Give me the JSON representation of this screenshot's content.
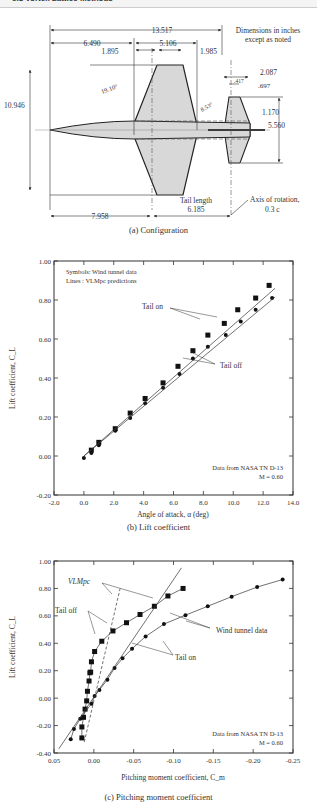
{
  "header": {
    "title": "6.8 Vortex Lattice Methods"
  },
  "figure_a": {
    "caption": "(a) Configuration",
    "note_line1": "Dimensions in inches",
    "note_line2": "except as noted",
    "dimensions": {
      "overall_length": "13.517",
      "nose_to_wing": "6.490",
      "wing_root_chord": "5.106",
      "wing_le_offset": "1.895",
      "wing_te_offset": "1.985",
      "span": "10.946",
      "wing_sweep": "19.10°",
      "tail_sweep": "8.53°",
      "tail_dim_1": "2.087",
      "tail_dim_2": ".417",
      "tail_dim_3": ".697",
      "tail_dim_4": "1.170",
      "tail_span": "5.560",
      "nose_to_axis": "7.958",
      "tail_length_label": "Tail length",
      "tail_length": "6.185",
      "axis_label_1": "Axis of rotation,",
      "axis_label_2": "0.3 c"
    }
  },
  "chart_data": [
    {
      "type": "scatter",
      "title": "(b) Lift coefficient",
      "xlabel": "Angle of attack, α (deg)",
      "ylabel": "Lift coefficient, C_L",
      "xlim": [
        -2.0,
        14.0
      ],
      "ylim": [
        -0.2,
        1.0
      ],
      "xticks": [
        "-2.0",
        "0.0",
        "2.0",
        "4.0",
        "6.0",
        "8.0",
        "10.0",
        "12.0",
        "14.0"
      ],
      "yticks": [
        "-0.20",
        "0.00",
        "0.20",
        "0.40",
        "0.60",
        "0.80",
        "1.00"
      ],
      "legend": [
        "Symbols: Wind tunnel data",
        "Lines : VLMpc predictions"
      ],
      "annotations": [
        "Tail on",
        "Tail off",
        "Data from NASA TN D-13",
        "M = 0.60"
      ],
      "series": [
        {
          "name": "Tail on (wind tunnel)",
          "marker": "square",
          "x": [
            0.5,
            1.0,
            2.1,
            3.1,
            4.1,
            5.3,
            6.3,
            7.3,
            8.3,
            9.4,
            10.3,
            11.5,
            12.4
          ],
          "y": [
            0.03,
            0.07,
            0.14,
            0.22,
            0.295,
            0.375,
            0.46,
            0.54,
            0.62,
            0.68,
            0.75,
            0.81,
            0.875
          ]
        },
        {
          "name": "Tail off (wind tunnel)",
          "marker": "circle",
          "x": [
            0.0,
            0.5,
            1.0,
            2.1,
            3.1,
            4.1,
            5.3,
            6.4,
            7.3,
            8.3,
            9.5,
            10.5,
            11.5,
            12.6
          ],
          "y": [
            -0.01,
            0.015,
            0.055,
            0.13,
            0.195,
            0.27,
            0.35,
            0.42,
            0.5,
            0.56,
            0.62,
            0.69,
            0.75,
            0.81
          ]
        },
        {
          "name": "Tail on (VLMpc)",
          "line": true,
          "x": [
            0.0,
            12.8
          ],
          "y": [
            0.0,
            0.86
          ]
        },
        {
          "name": "Tail off (VLMpc)",
          "line": true,
          "x": [
            0.0,
            12.8
          ],
          "y": [
            0.0,
            0.815
          ]
        }
      ]
    },
    {
      "type": "line",
      "title": "(c) Pitching moment coefficient",
      "xlabel": "Pitching moment coefficient, C_m",
      "ylabel": "Lift coefficient, C_L",
      "xlim": [
        0.05,
        -0.25
      ],
      "ylim": [
        -0.4,
        1.0
      ],
      "xticks": [
        "0.05",
        "0.00",
        "-0.05",
        "-0.10",
        "-0.15",
        "-0.20",
        "-0.25"
      ],
      "yticks": [
        "-0.40",
        "-0.20",
        "0.00",
        "0.20",
        "0.40",
        "0.60",
        "0.80",
        "1.00"
      ],
      "annotations": [
        "VLMpc",
        "Tail off",
        "Tail on",
        "Wind tunnel data",
        "Data from NASA TN D-13",
        "M = 0.60"
      ],
      "series": [
        {
          "name": "Tail off (wind tunnel)",
          "marker": "square",
          "x": [
            0.015,
            0.015,
            0.013,
            0.011,
            0.009,
            0.008,
            0.006,
            0.005,
            0.004,
            0.003,
            -0.001,
            -0.01,
            -0.024,
            -0.041,
            -0.058,
            -0.076,
            -0.093,
            -0.112
          ],
          "y": [
            -0.29,
            -0.21,
            -0.14,
            -0.08,
            -0.02,
            0.05,
            0.125,
            0.185,
            0.19,
            0.265,
            0.34,
            0.415,
            0.49,
            0.55,
            0.61,
            0.67,
            0.745,
            0.8
          ]
        },
        {
          "name": "Tail on (wind tunnel)",
          "marker": "circle",
          "x": [
            0.029,
            0.025,
            0.017,
            0.003,
            -0.001,
            -0.007,
            -0.017,
            -0.026,
            -0.036,
            -0.048,
            -0.065,
            -0.088,
            -0.115,
            -0.143,
            -0.173,
            -0.205,
            -0.237
          ],
          "y": [
            -0.3,
            -0.225,
            -0.15,
            -0.04,
            0.015,
            0.06,
            0.135,
            0.22,
            0.29,
            0.36,
            0.45,
            0.54,
            0.605,
            0.67,
            0.74,
            0.81,
            0.865
          ]
        },
        {
          "name": "Tail off (VLMpc)",
          "dashed": true,
          "x": [
            0.012,
            -0.033
          ],
          "y": [
            -0.32,
            0.8
          ]
        },
        {
          "name": "Tail on (VLMpc)",
          "line": true,
          "x": [
            0.044,
            -0.11
          ],
          "y": [
            -0.37,
            0.95
          ]
        }
      ]
    }
  ]
}
